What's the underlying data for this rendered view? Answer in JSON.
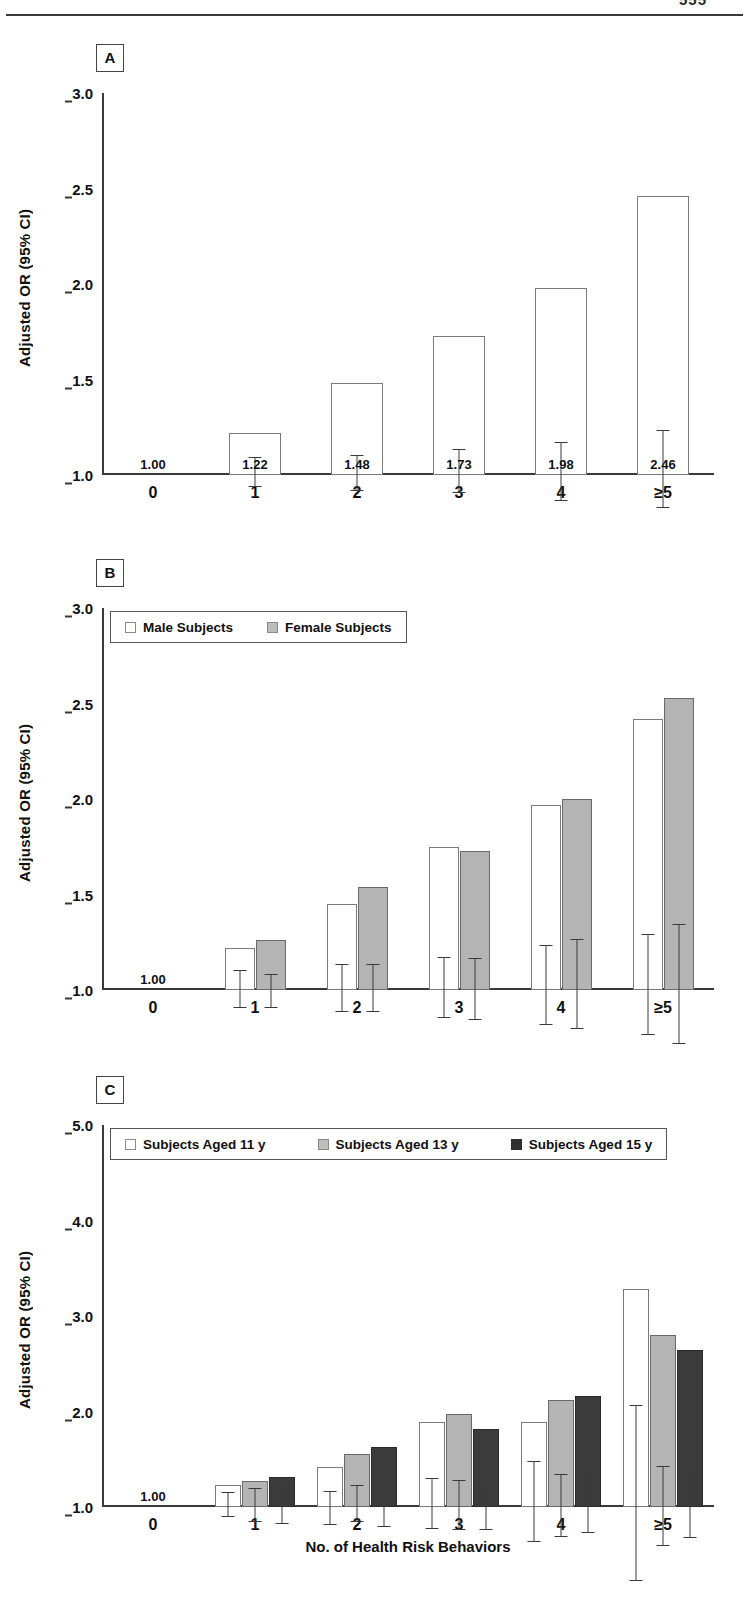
{
  "page": {
    "number": "555"
  },
  "figure": {
    "xlabel": "No. of Health Risk Behaviors",
    "ylabel": "Adjusted OR (95% CI)",
    "categories": [
      "0",
      "1",
      "2",
      "3",
      "4",
      "≥5"
    ]
  },
  "panels": {
    "a": {
      "tag": "A",
      "ylabel": "Adjusted OR (95% CI)",
      "yticks": [
        "3.0",
        "2.5",
        "2.0",
        "1.5",
        "1.0"
      ],
      "value_labels": [
        "1.00",
        "1.22",
        "1.48",
        "1.73",
        "1.98",
        "2.46"
      ]
    },
    "b": {
      "tag": "B",
      "ylabel": "Adjusted OR (95% CI)",
      "yticks": [
        "3.0",
        "2.5",
        "2.0",
        "1.5",
        "1.0"
      ],
      "reference_label": "1.00",
      "legend": [
        {
          "label": "Male Subjects",
          "swatch": "white"
        },
        {
          "label": "Female Subjects",
          "swatch": "gray"
        }
      ]
    },
    "c": {
      "tag": "C",
      "ylabel": "Adjusted OR (95% CI)",
      "yticks": [
        "5.0",
        "4.0",
        "3.0",
        "2.0",
        "1.0"
      ],
      "reference_label": "1.00",
      "legend": [
        {
          "label": "Subjects Aged 11 y",
          "swatch": "white"
        },
        {
          "label": "Subjects Aged 13 y",
          "swatch": "gray"
        },
        {
          "label": "Subjects Aged 15 y",
          "swatch": "dark"
        }
      ]
    }
  },
  "chart_data": [
    {
      "type": "bar",
      "panel": "A",
      "title": "A",
      "xlabel": "No. of Health Risk Behaviors",
      "ylabel": "Adjusted OR (95% CI)",
      "ylim": [
        1.0,
        3.0
      ],
      "yticks": [
        3.0,
        2.5,
        2.0,
        1.5,
        1.0
      ],
      "grid": false,
      "legend": null,
      "categories": [
        "0",
        "1",
        "2",
        "3",
        "4",
        "≥5"
      ],
      "values": [
        1.0,
        1.22,
        1.48,
        1.73,
        1.98,
        2.46
      ],
      "data_labels": [
        "1.00",
        "1.22",
        "1.48",
        "1.73",
        "1.98",
        "2.46"
      ],
      "ci_low": [
        null,
        1.15,
        1.39,
        1.63,
        1.84,
        2.28
      ],
      "ci_high": [
        null,
        1.31,
        1.58,
        1.86,
        2.15,
        2.69
      ],
      "bar_style": [
        "reference",
        "white",
        "white",
        "white",
        "white",
        "white"
      ]
    },
    {
      "type": "bar",
      "panel": "B",
      "title": "B",
      "xlabel": "No. of Health Risk Behaviors",
      "ylabel": "Adjusted OR (95% CI)",
      "ylim": [
        1.0,
        3.0
      ],
      "yticks": [
        3.0,
        2.5,
        2.0,
        1.5,
        1.0
      ],
      "grid": false,
      "legend_position": "top-left",
      "categories": [
        "0",
        "1",
        "2",
        "3",
        "4",
        "≥5"
      ],
      "reference_label": "1.00",
      "series": [
        {
          "name": "Male Subjects",
          "style": "white",
          "values": [
            1.0,
            1.22,
            1.45,
            1.75,
            1.97,
            2.42
          ],
          "ci_low": [
            null,
            1.12,
            1.33,
            1.6,
            1.78,
            2.18
          ],
          "ci_high": [
            null,
            1.32,
            1.58,
            1.92,
            2.2,
            2.71
          ]
        },
        {
          "name": "Female Subjects",
          "style": "gray",
          "values": [
            1.0,
            1.26,
            1.54,
            1.73,
            2.0,
            2.53
          ],
          "ci_low": [
            null,
            1.16,
            1.42,
            1.57,
            1.79,
            2.24
          ],
          "ci_high": [
            null,
            1.34,
            1.67,
            1.89,
            2.26,
            2.87
          ]
        }
      ]
    },
    {
      "type": "bar",
      "panel": "C",
      "title": "C",
      "xlabel": "No. of Health Risk Behaviors",
      "ylabel": "Adjusted OR (95% CI)",
      "ylim": [
        1.0,
        5.0
      ],
      "yticks": [
        5.0,
        4.0,
        3.0,
        2.0,
        1.0
      ],
      "grid": false,
      "legend_position": "top-left",
      "categories": [
        "0",
        "1",
        "2",
        "3",
        "4",
        "≥5"
      ],
      "reference_label": "1.00",
      "series": [
        {
          "name": "Subjects Aged 11 y",
          "style": "white",
          "values": [
            1.0,
            1.23,
            1.42,
            1.89,
            1.89,
            3.28
          ],
          "ci_low": [
            null,
            1.11,
            1.22,
            1.65,
            1.51,
            2.49
          ],
          "ci_high": [
            null,
            1.38,
            1.58,
            2.18,
            2.36,
            4.34
          ]
        },
        {
          "name": "Subjects Aged 13 y",
          "style": "gray",
          "values": [
            1.0,
            1.27,
            1.55,
            1.97,
            2.12,
            2.8
          ],
          "ci_low": [
            null,
            1.1,
            1.38,
            1.72,
            1.8,
            2.38
          ],
          "ci_high": [
            null,
            1.46,
            1.77,
            2.24,
            2.46,
            3.22
          ]
        },
        {
          "name": "Subjects Aged 15 y",
          "style": "dark",
          "values": [
            1.0,
            1.31,
            1.63,
            1.82,
            2.16,
            2.64
          ],
          "ci_low": [
            null,
            1.12,
            1.41,
            1.57,
            1.88,
            2.3
          ],
          "ci_high": [
            null,
            1.52,
            1.85,
            2.08,
            2.5,
            3.03
          ]
        }
      ]
    }
  ]
}
